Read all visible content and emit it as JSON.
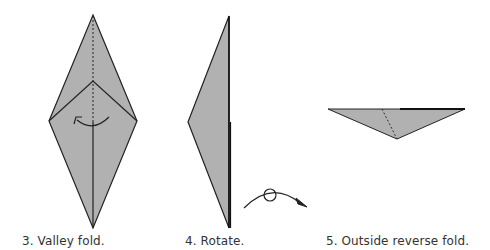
{
  "steps": [
    {
      "number": "3",
      "caption": "3. Valley fold."
    },
    {
      "number": "4",
      "caption": "4. Rotate."
    },
    {
      "number": "5",
      "caption": "5. Outside reverse fold."
    }
  ],
  "colors": {
    "paper": "#b1b1b1",
    "line": "#222222",
    "background": "#ffffff"
  },
  "symbols": {
    "valley_fold_arrow": "curved-arrow-left",
    "rotate_arrow": "rotate-symbol"
  }
}
